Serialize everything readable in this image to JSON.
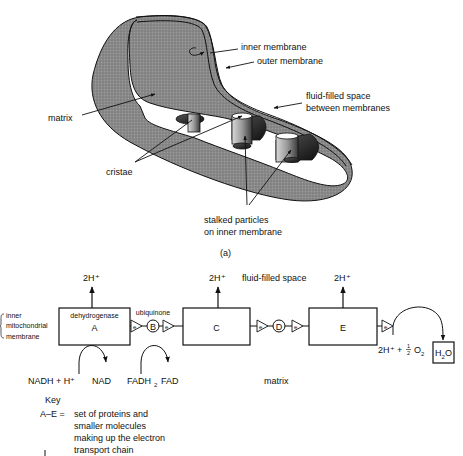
{
  "figure": {
    "part_a": {
      "caption": "(a)",
      "labels": {
        "inner_membrane": "inner membrane",
        "outer_membrane": "outer membrane",
        "fluid_space_line1": "fluid-filled space",
        "fluid_space_line2": "between membranes",
        "matrix": "matrix",
        "cristae": "cristae",
        "stalked_line1": "stalked particles",
        "stalked_line2": "on inner membrane"
      }
    },
    "part_b": {
      "side_label": [
        "inner",
        "mitochondrial",
        "membrane"
      ],
      "proton_label": "2H⁺",
      "fluid_space": "fluid-filled space",
      "matrix": "matrix",
      "complexes": {
        "A": {
          "name": "A",
          "sub": "dehydrogenase"
        },
        "B": {
          "name": "B",
          "sub": "ubiquinone"
        },
        "C": {
          "name": "C"
        },
        "D": {
          "name": "D"
        },
        "E": {
          "name": "E"
        }
      },
      "electron": "e",
      "substrates": {
        "nadh": "NADH + H⁺",
        "nad": "NAD",
        "fadh2": "FADH",
        "fadh2_sub": "2",
        "fad": "FAD"
      },
      "oxygen": {
        "protons": "2H⁺ + ",
        "half_num": "1",
        "half_den": "2",
        "o2": "O",
        "o2_sub": "2",
        "water": "H",
        "water_sub": "2",
        "water_o": "O"
      },
      "key": {
        "title": "Key",
        "term": "A–E =",
        "lines": [
          "set of proteins and",
          "smaller molecules",
          "making up the electron",
          "transport chain"
        ]
      }
    }
  }
}
